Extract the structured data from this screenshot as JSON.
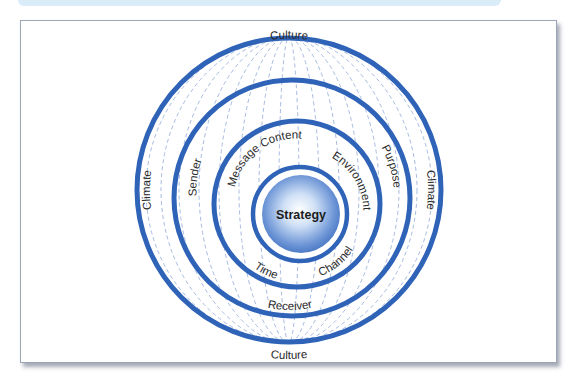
{
  "diagram": {
    "title": "",
    "core": {
      "label": "Strategy"
    },
    "rings": [
      {
        "name": "outer",
        "labels": {
          "top": "Culture",
          "bottom": "Culture",
          "left": "Climate",
          "right": "Climate"
        }
      },
      {
        "name": "middle",
        "labels": {
          "left": "Sender",
          "right": "Purpose",
          "bottom": "Receiver"
        }
      },
      {
        "name": "inner",
        "labels": {
          "top_left": "Message Content",
          "top_right": "Environment",
          "bottom_left": "Time",
          "bottom_right": "Channel"
        }
      }
    ],
    "colors": {
      "ring_stroke": "#2f63b8",
      "dash_lines": "#8fa8d8",
      "core_light": "#ffffff",
      "core_dark": "#3f6fbf",
      "header_band": "#d9ecf8"
    }
  }
}
